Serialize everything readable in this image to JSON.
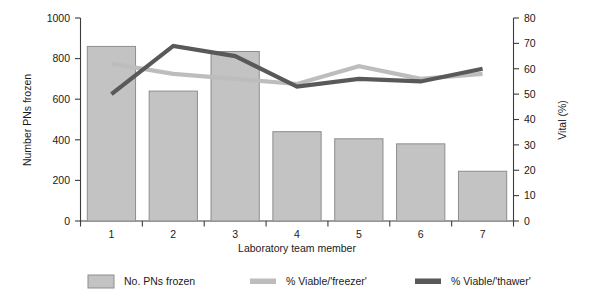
{
  "chart_data": {
    "type": "bar",
    "title": "",
    "subtitle": "",
    "xlabel": "Laboratory team member",
    "ylabel": "Number PNs frozen",
    "y2label": "Vital (%)",
    "categories": [
      "1",
      "2",
      "3",
      "4",
      "5",
      "6",
      "7"
    ],
    "ylim": [
      0,
      1000
    ],
    "yticks": [
      0,
      200,
      400,
      600,
      800,
      1000
    ],
    "y2lim": [
      0,
      80
    ],
    "y2ticks": [
      0,
      10,
      20,
      30,
      40,
      50,
      60,
      70,
      80
    ],
    "grid": false,
    "legend_position": "bottom",
    "series": [
      {
        "name": "No. PNs frozen",
        "type": "bar",
        "axis": "left",
        "color": "#c3c3c3",
        "edge_color": "#8d8d8d",
        "values": [
          860,
          640,
          835,
          440,
          405,
          380,
          245
        ]
      },
      {
        "name": "% Viable/'freezer'",
        "type": "line",
        "axis": "right",
        "color": "#bdbdbd",
        "values": [
          62,
          58,
          56,
          54,
          61,
          56,
          58
        ]
      },
      {
        "name": "% Viable/'thawer'",
        "type": "line",
        "axis": "right",
        "color": "#595959",
        "values": [
          50,
          69,
          65,
          53,
          56,
          55,
          60
        ]
      }
    ]
  },
  "legend": {
    "items": [
      {
        "label": "No. PNs frozen",
        "marker": "bar-swatch",
        "color": "#c3c3c3"
      },
      {
        "label": "% Viable/'freezer'",
        "marker": "line-swatch",
        "color": "#bdbdbd"
      },
      {
        "label": "% Viable/'thawer'",
        "marker": "line-swatch",
        "color": "#595959"
      }
    ]
  },
  "axes": {
    "left_title": "Number PNs frozen",
    "right_title": "Vital (%)",
    "bottom_title": "Laboratory team member"
  }
}
